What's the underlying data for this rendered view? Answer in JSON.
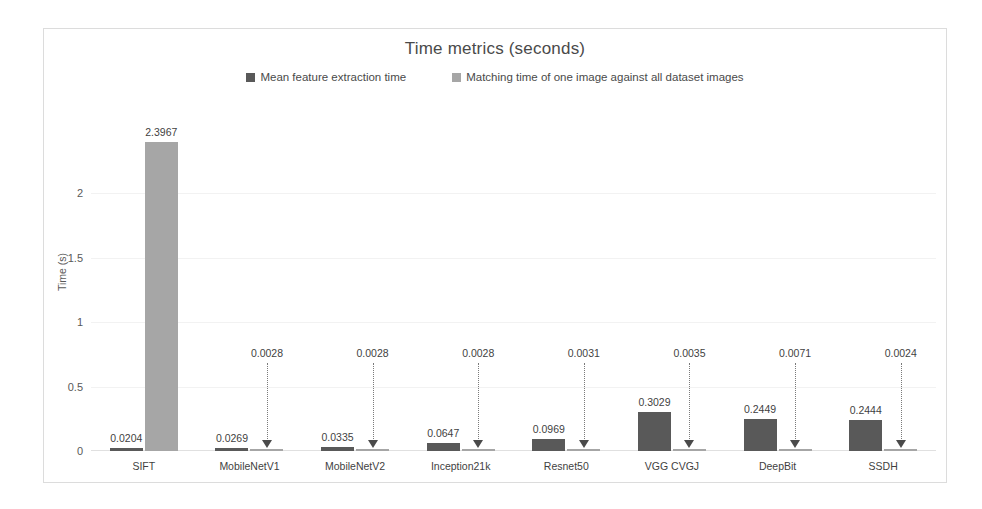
{
  "chart_data": {
    "type": "bar",
    "title": "Time metrics (seconds)",
    "xlabel": "",
    "ylabel": "Time (s)",
    "ylim": [
      0,
      2.5
    ],
    "yticks": [
      "0",
      "0.5",
      "1",
      "1.5",
      "2"
    ],
    "ytick_values": [
      0,
      0.5,
      1,
      1.5,
      2
    ],
    "grid": true,
    "legend_position": "top-center",
    "categories": [
      "SIFT",
      "MobileNetV1",
      "MobileNetV2",
      "Inception21k",
      "Resnet50",
      "VGG CVGJ",
      "DeepBit",
      "SSDH"
    ],
    "series": [
      {
        "name": "Mean feature extraction time",
        "color": "#595959",
        "values": [
          0.0204,
          0.0269,
          0.0335,
          0.0647,
          0.0969,
          0.3029,
          0.2449,
          0.2444
        ],
        "labels": [
          "0.0204",
          "0.0269",
          "0.0335",
          "0.0647",
          "0.0969",
          "0.3029",
          "0.2449",
          "0.2444"
        ]
      },
      {
        "name": "Matching time of one image against all dataset images",
        "color": "#a6a6a6",
        "values": [
          2.3967,
          0.0028,
          0.0028,
          0.0028,
          0.0031,
          0.0035,
          0.0071,
          0.0024
        ],
        "labels": [
          "2.3967",
          "0.0028",
          "0.0028",
          "0.0028",
          "0.0031",
          "0.0035",
          "0.0071",
          "0.0024"
        ]
      }
    ]
  }
}
